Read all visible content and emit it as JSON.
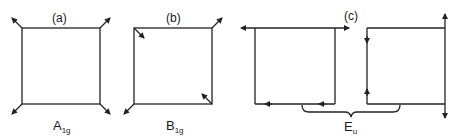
{
  "panels": [
    {
      "id": "a",
      "label": "(a)",
      "symmetry": "A",
      "subscript": "1g"
    },
    {
      "id": "b",
      "label": "(b)",
      "symmetry": "B",
      "subscript": "1g"
    },
    {
      "id": "c",
      "label": "(c)",
      "symmetry": "E",
      "subscript": "u"
    }
  ],
  "colors": {
    "line": "#222222",
    "background": "#ffffff"
  }
}
